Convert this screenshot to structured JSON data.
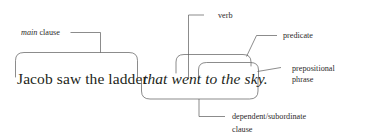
{
  "diagram": {
    "type": "sentence-diagram",
    "background_color": "#ffffff",
    "line_color": "#5a5a5a",
    "text_color": "#231f20",
    "sentence": {
      "main_clause_text": "Jacob saw the ladder",
      "subordinate_clause_text": "that went to the sky.",
      "full_text": "Jacob saw the ladder that went to the sky."
    },
    "labels": {
      "main_clause": {
        "italic_part": "main",
        "roman_part": " clause"
      },
      "verb": "verb",
      "predicate": "predicate",
      "prepositional_phrase_line1": "prepositional",
      "prepositional_phrase_line2": "phrase",
      "dependent_clause_line1": "dependent/subordinate",
      "dependent_clause_line2": "clause"
    },
    "annotations": [
      {
        "name": "main-clause",
        "label": "main clause",
        "spans": "Jacob saw the ladder",
        "bracket": "above"
      },
      {
        "name": "verb",
        "label": "verb",
        "spans": "went",
        "bracket": "pointer-line"
      },
      {
        "name": "predicate",
        "label": "predicate",
        "spans": "went to the sky",
        "bracket": "above"
      },
      {
        "name": "prepositional-phrase",
        "label": "prepositional phrase",
        "spans": "to the sky",
        "bracket": "above"
      },
      {
        "name": "dependent-clause",
        "label": "dependent/subordinate clause",
        "spans": "that went to the sky.",
        "bracket": "below"
      }
    ]
  }
}
